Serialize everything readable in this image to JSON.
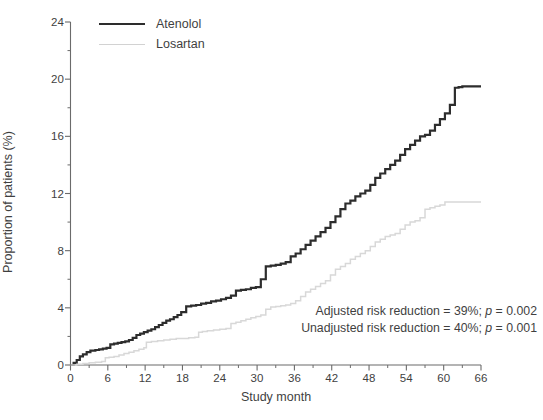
{
  "chart_data": {
    "type": "line",
    "title": "",
    "subtitle": "",
    "xlabel": "Study month",
    "ylabel": "Proportion of patients (%)",
    "xlim": [
      0,
      66
    ],
    "ylim": [
      0,
      24
    ],
    "x_major_ticks": [
      0,
      6,
      12,
      18,
      24,
      30,
      36,
      42,
      48,
      54,
      60,
      66
    ],
    "x_minor_ticks": [
      3,
      9,
      15,
      21,
      27,
      33,
      39,
      45,
      51,
      57,
      63
    ],
    "y_major_ticks": [
      0,
      4,
      8,
      12,
      16,
      20,
      24
    ],
    "y_minor_ticks": [
      2,
      6,
      10,
      14,
      18,
      22
    ],
    "x_tick_labels": [
      "0",
      "6",
      "12",
      "18",
      "24",
      "30",
      "36",
      "42",
      "48",
      "54",
      "60",
      "66"
    ],
    "y_tick_labels": [
      "0",
      "4",
      "8",
      "12",
      "16",
      "20",
      "24"
    ],
    "grid": false,
    "legend_position": "top-left",
    "step_style": "post",
    "series": [
      {
        "name": "Atenolol",
        "color": "#2d2d2d",
        "line_width": 2.2,
        "x": [
          0,
          0.5,
          1.0,
          1.5,
          2.0,
          2.6,
          3.2,
          4.0,
          4.6,
          5.2,
          5.8,
          6.4,
          7.0,
          7.6,
          8.2,
          8.8,
          9.4,
          10.0,
          10.6,
          11.2,
          11.8,
          12.4,
          13.0,
          13.6,
          14.2,
          14.8,
          15.4,
          16.0,
          16.6,
          17.2,
          17.8,
          18.6,
          19.4,
          20.2,
          21.0,
          21.8,
          22.6,
          23.4,
          24.2,
          25.0,
          25.8,
          26.6,
          27.4,
          28.2,
          29.0,
          29.8,
          30.6,
          31.4,
          32.2,
          33.0,
          33.8,
          34.6,
          35.4,
          36.2,
          37.0,
          37.8,
          38.6,
          39.4,
          40.2,
          41.0,
          41.8,
          42.6,
          43.4,
          44.2,
          45.0,
          45.8,
          46.6,
          47.4,
          48.2,
          49.0,
          49.8,
          50.6,
          51.4,
          52.2,
          53.0,
          53.8,
          54.6,
          55.4,
          56.2,
          57.0,
          57.8,
          58.6,
          59.4,
          60.2,
          61.0,
          61.8,
          62.4,
          63.0,
          63.6,
          66.0
        ],
        "y": [
          0.0,
          0.15,
          0.35,
          0.6,
          0.75,
          0.9,
          1.0,
          1.05,
          1.1,
          1.15,
          1.2,
          1.45,
          1.5,
          1.55,
          1.6,
          1.65,
          1.75,
          1.9,
          2.1,
          2.2,
          2.3,
          2.4,
          2.5,
          2.65,
          2.8,
          2.95,
          3.1,
          3.2,
          3.35,
          3.5,
          3.7,
          4.1,
          4.15,
          4.2,
          4.3,
          4.35,
          4.45,
          4.5,
          4.6,
          4.7,
          4.85,
          5.2,
          5.25,
          5.3,
          5.4,
          5.45,
          6.0,
          6.9,
          6.95,
          7.0,
          7.1,
          7.2,
          7.6,
          7.8,
          8.1,
          8.4,
          8.7,
          9.0,
          9.3,
          9.6,
          10.0,
          10.4,
          10.9,
          11.3,
          11.5,
          11.8,
          12.0,
          12.2,
          12.6,
          13.1,
          13.4,
          13.7,
          14.0,
          14.3,
          14.7,
          15.1,
          15.4,
          15.7,
          16.0,
          16.1,
          16.4,
          16.8,
          17.2,
          17.6,
          18.2,
          19.4,
          19.45,
          19.5,
          19.5,
          19.5
        ]
      },
      {
        "name": "Losartan",
        "color": "#d8d8d8",
        "line_width": 1.5,
        "x": [
          0,
          1.0,
          2.0,
          3.0,
          4.0,
          5.0,
          5.6,
          6.2,
          7.0,
          7.8,
          8.6,
          9.4,
          10.2,
          11.0,
          11.8,
          12.2,
          13.0,
          14.0,
          15.0,
          16.0,
          17.0,
          18.0,
          19.0,
          20.0,
          20.6,
          21.2,
          22.0,
          23.0,
          24.0,
          25.0,
          25.8,
          26.6,
          27.4,
          28.2,
          29.0,
          29.8,
          30.6,
          31.4,
          32.2,
          33.0,
          33.8,
          34.6,
          35.4,
          36.2,
          37.0,
          37.8,
          38.6,
          39.4,
          40.2,
          41.0,
          41.8,
          42.6,
          43.4,
          44.2,
          45.0,
          45.8,
          46.6,
          47.4,
          48.2,
          49.0,
          49.8,
          50.6,
          51.4,
          52.2,
          53.0,
          53.8,
          54.6,
          55.4,
          56.2,
          57.0,
          57.8,
          58.6,
          59.4,
          60.2,
          61.0,
          66.0
        ],
        "y": [
          0.0,
          0.05,
          0.1,
          0.15,
          0.2,
          0.25,
          0.5,
          0.55,
          0.6,
          0.7,
          0.8,
          0.9,
          1.0,
          1.1,
          1.2,
          1.6,
          1.65,
          1.7,
          1.75,
          1.8,
          1.85,
          1.85,
          1.9,
          1.95,
          2.3,
          2.35,
          2.4,
          2.45,
          2.5,
          2.55,
          2.9,
          3.0,
          3.1,
          3.2,
          3.3,
          3.4,
          3.5,
          3.9,
          4.05,
          4.1,
          4.15,
          4.2,
          4.3,
          4.5,
          4.8,
          5.1,
          5.3,
          5.5,
          5.7,
          5.9,
          6.3,
          6.7,
          6.9,
          7.1,
          7.4,
          7.6,
          7.8,
          8.0,
          8.3,
          8.6,
          8.8,
          9.0,
          9.1,
          9.2,
          9.5,
          9.8,
          10.0,
          10.1,
          10.3,
          10.9,
          11.0,
          11.1,
          11.2,
          11.4,
          11.4,
          11.4
        ]
      }
    ],
    "annotations": [
      {
        "id": "adjusted-risk-reduction",
        "prefix": "Adjusted risk reduction = 39%; ",
        "italic": "p",
        "suffix": " = 0.002"
      },
      {
        "id": "unadjusted-risk-reduction",
        "prefix": "Unadjusted risk reduction = 40%; ",
        "italic": "p",
        "suffix": " = 0.001"
      }
    ]
  },
  "legend": {
    "items": [
      {
        "label": "Atenolol",
        "color": "#2d2d2d"
      },
      {
        "label": "Losartan",
        "color": "#d2d2d2"
      }
    ]
  },
  "axes": {
    "x_title": "Study month",
    "y_title": "Proportion of patients (%)"
  },
  "colors": {
    "axis": "#6b6b6b",
    "text": "#3f3f3f",
    "background": "#ffffff",
    "atenolol": "#2d2d2d",
    "losartan": "#d8d8d8"
  }
}
